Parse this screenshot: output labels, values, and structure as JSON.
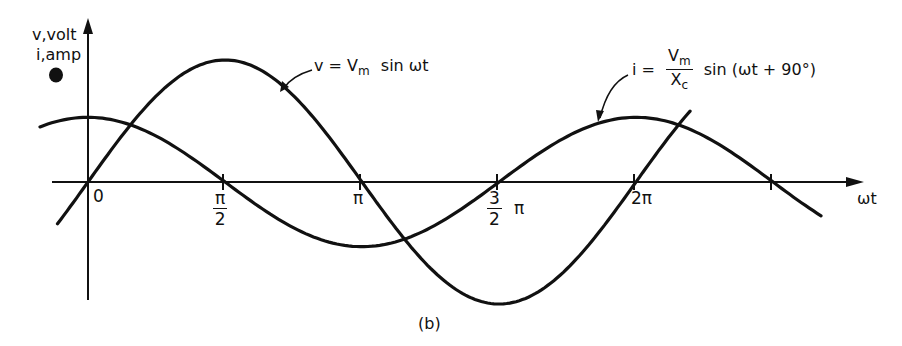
{
  "figure": {
    "caption": "(b)",
    "y_axis_label_line1": "v,volt",
    "y_axis_label_line2": "i,amp",
    "x_axis_label": "ωt",
    "origin_label": "0",
    "ticks": {
      "pi_over_2": {
        "num": "π",
        "den": "2"
      },
      "pi": "π",
      "three_pi_over_2": {
        "num": "3",
        "den": "2",
        "suffix": "π"
      },
      "two_pi": "2π"
    },
    "voltage_label": {
      "lhs": "v =",
      "V": "V",
      "sub": "m",
      "rhs": "sin ωt"
    },
    "current_label": {
      "lhs": "i =",
      "num_V": "V",
      "num_sub": "m",
      "den_X": "X",
      "den_sub": "c",
      "rhs": "sin (ωt + 90°)"
    }
  },
  "chart_data": {
    "type": "line",
    "title": "",
    "xlabel": "ωt",
    "ylabel": "v,volt / i,amp",
    "x_ticks": [
      "0",
      "π/2",
      "π",
      "3π/2",
      "2π",
      "5π/2"
    ],
    "x_range": [
      "-π/4",
      "11π/4"
    ],
    "grid": false,
    "series": [
      {
        "name": "v = Vm sin ωt",
        "function": "Vm*sin(ωt)",
        "relative_amplitude": 1.0,
        "x": [
          "0",
          "π/2",
          "π",
          "3π/2",
          "2π"
        ],
        "values": [
          0,
          1,
          0,
          -1,
          0
        ]
      },
      {
        "name": "i = (Vm/Xc) sin(ωt + 90°)",
        "function": "(Vm/Xc)*sin(ωt+90°)",
        "relative_amplitude": 0.53,
        "x": [
          "0",
          "π/2",
          "π",
          "3π/2",
          "2π",
          "5π/2"
        ],
        "values": [
          0.53,
          0,
          -0.53,
          0,
          0.53,
          0
        ]
      }
    ],
    "annotations": [
      "v = Vm sin ωt",
      "i = Vm/Xc sin (ωt + 90°)",
      "(b)"
    ]
  }
}
